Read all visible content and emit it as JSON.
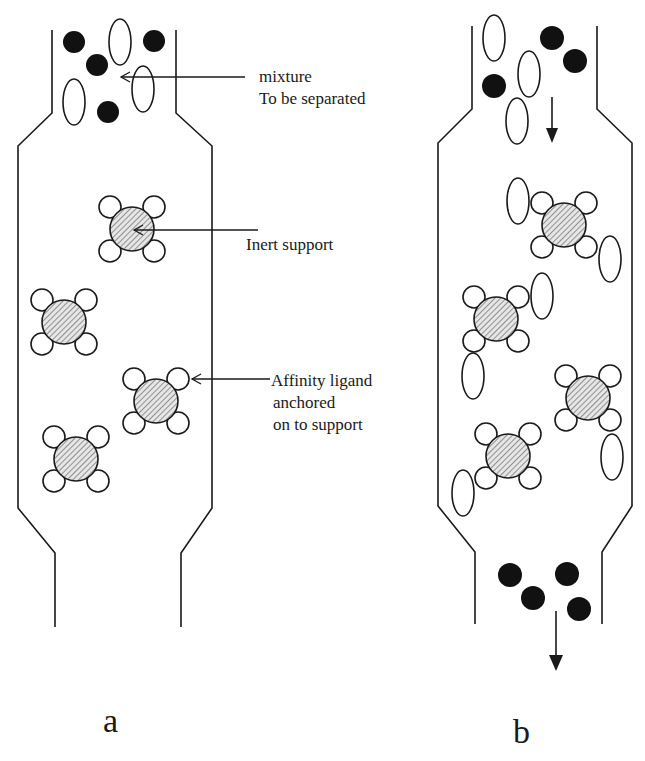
{
  "diagram": {
    "type": "affinity chromatography schematic",
    "colors": {
      "stroke": "#1a1a1a",
      "fill_solute": "#111111",
      "bead_hatch": "#555555",
      "background": "#ffffff"
    }
  },
  "panel_a": {
    "label": "a",
    "annotations": {
      "mixture_line1": "mixture",
      "mixture_line2": "To be separated",
      "inert_support": "Inert support",
      "ligand_line1": "Affinity ligand",
      "ligand_line2": "anchored",
      "ligand_line3": "on to support"
    }
  },
  "panel_b": {
    "label": "b"
  }
}
